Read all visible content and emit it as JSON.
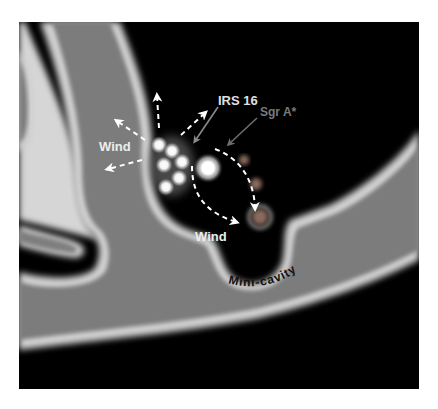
{
  "diagram": {
    "colors": {
      "background": "#000000",
      "gas": "#7a7a7a",
      "gas_edge": "#d8d8d8",
      "wind_arrow": "#ffffff",
      "irs16_pointer": "#8a8a8a",
      "sgra_pointer": "#6e6e6e",
      "sgra_dot": "#9a7060"
    },
    "labels": {
      "irs16": "IRS 16",
      "sgra": "Sgr A*",
      "wind_left": "Wind",
      "wind_bottom": "Wind",
      "mini_cavity": "Mini-cavity"
    },
    "stars": {
      "irs16_cluster_count": 6,
      "bright_star": "central bright star"
    }
  }
}
